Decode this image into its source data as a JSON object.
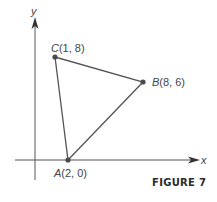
{
  "figure": {
    "caption": "FIGURE 7",
    "axes": {
      "x_label": "x",
      "y_label": "y"
    },
    "points": {
      "A": {
        "name": "A",
        "coords": "(2, 0)",
        "x": 2,
        "y": 0
      },
      "B": {
        "name": "B",
        "coords": "(8, 6)",
        "x": 8,
        "y": 6
      },
      "C": {
        "name": "C",
        "coords": "(1, 8)",
        "x": 1,
        "y": 8
      }
    },
    "colors": {
      "line": "#555555",
      "point": "#4a4a4a",
      "text": "#444444"
    }
  }
}
